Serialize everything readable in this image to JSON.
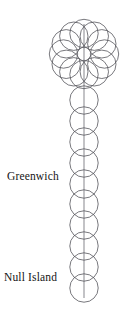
{
  "figure": {
    "background_color": "#ffffff",
    "stroke_color": "#55555c",
    "label_color": "#141414",
    "width": 130,
    "height": 311
  },
  "labels": [
    {
      "name": "greenwich",
      "text": "Greenwich",
      "x": 7,
      "y": 180,
      "anchor": "start"
    },
    {
      "name": "null-island",
      "text": "Null Island",
      "x": 4,
      "y": 281,
      "anchor": "start"
    }
  ],
  "meridian": {
    "name": "prime-meridian",
    "x": 84,
    "y_top": 24,
    "y_bottom": 298
  },
  "chart_data": {
    "type": "scatter",
    "xlabel": "",
    "ylabel": "",
    "grid": false,
    "legend": null,
    "xlim": [
      0,
      130
    ],
    "ylim": [
      311,
      0
    ],
    "annotations": [
      {
        "text": "Greenwich",
        "x": 7,
        "y": 180
      },
      {
        "text": "Null Island",
        "x": 4,
        "y": 281
      }
    ],
    "series": [
      {
        "name": "rosette-ring",
        "marker": "open-circle",
        "radius": 14.2,
        "center": [
          84,
          54
        ],
        "ring_radius": 20.5,
        "count": 12,
        "points": [
          [
            84.0,
            33.5
          ],
          [
            94.3,
            36.2
          ],
          [
            101.8,
            43.8
          ],
          [
            104.5,
            54.0
          ],
          [
            101.8,
            64.3
          ],
          [
            94.3,
            71.8
          ],
          [
            84.0,
            74.5
          ],
          [
            73.8,
            71.8
          ],
          [
            66.2,
            64.3
          ],
          [
            63.5,
            54.0
          ],
          [
            66.2,
            43.8
          ],
          [
            73.8,
            36.2
          ]
        ]
      },
      {
        "name": "meridian-chain",
        "marker": "open-circle",
        "radius": 14.2,
        "spacing": 20.9,
        "count": 10,
        "points": [
          [
            84,
            100
          ],
          [
            84,
            121
          ],
          [
            84,
            142
          ],
          [
            84,
            163
          ],
          [
            84,
            184
          ],
          [
            84,
            204
          ],
          [
            84,
            225
          ],
          [
            84,
            246
          ],
          [
            84,
            267
          ],
          [
            84,
            288
          ]
        ]
      }
    ]
  }
}
